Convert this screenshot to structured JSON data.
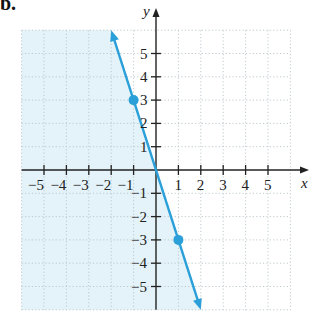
{
  "figure": {
    "part_label": "b.",
    "x_axis_label": "x",
    "y_axis_label": "y"
  },
  "colors": {
    "shade": "#e3f3f9",
    "line": "#2a9fd8",
    "axis": "#222222",
    "grid": "#b9c4c8"
  },
  "chart_data": {
    "type": "line",
    "title": "",
    "xlabel": "x",
    "ylabel": "y",
    "xlim": [
      -6,
      6
    ],
    "ylim": [
      -6,
      6
    ],
    "x_ticks": [
      -5,
      -4,
      -3,
      -2,
      -1,
      1,
      2,
      3,
      4,
      5
    ],
    "y_ticks": [
      -5,
      -4,
      -3,
      -2,
      -1,
      1,
      2,
      3,
      4,
      5
    ],
    "grid": true,
    "grid_style": "dotted",
    "series": [
      {
        "name": "boundary line y = -3x",
        "type": "line",
        "x": [
          -2,
          2
        ],
        "y": [
          6,
          -6
        ],
        "arrows_both_ends": true,
        "marked_points": [
          {
            "x": -1,
            "y": 3
          },
          {
            "x": 1,
            "y": -3
          }
        ]
      }
    ],
    "shaded_region": {
      "description": "half-plane to the left of the line (y < -3x)",
      "side": "left"
    }
  }
}
